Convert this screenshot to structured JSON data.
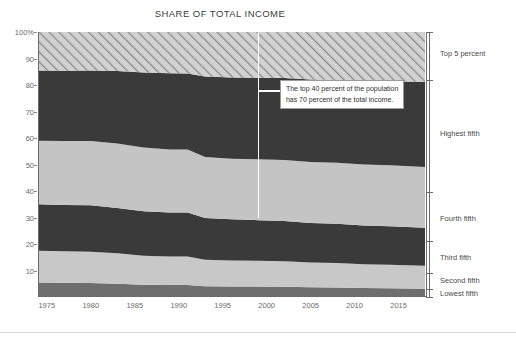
{
  "chart_data": {
    "type": "area",
    "title": "SHARE OF TOTAL INCOME",
    "xlabel": "",
    "ylabel": "",
    "xlim": [
      1974,
      2018
    ],
    "ylim": [
      0,
      100
    ],
    "grid": false,
    "legend_position": "right-bracket",
    "stacked": true,
    "y_ticks": [
      "100%",
      "90",
      "80",
      "70",
      "60",
      "50",
      "40",
      "30",
      "20",
      "10"
    ],
    "y_tick_values": [
      100,
      90,
      80,
      70,
      60,
      50,
      40,
      30,
      20,
      10
    ],
    "x_ticks": [
      "1975",
      "1980",
      "1985",
      "1990",
      "1995",
      "2000",
      "2005",
      "2010",
      "2015"
    ],
    "x_tick_values": [
      1975,
      1980,
      1985,
      1990,
      1995,
      2000,
      2005,
      2010,
      2015
    ],
    "x": [
      1974,
      1977,
      1980,
      1983,
      1986,
      1989,
      1991,
      1993,
      1996,
      1999,
      2002,
      2005,
      2008,
      2011,
      2014,
      2018
    ],
    "series": [
      {
        "name": "Lowest fifth",
        "color": "#6e6e6e",
        "values": [
          5.5,
          5.4,
          5.3,
          5.0,
          4.6,
          4.5,
          4.5,
          4.1,
          4.0,
          4.0,
          3.9,
          3.7,
          3.6,
          3.4,
          3.3,
          3.1
        ]
      },
      {
        "name": "Second fifth",
        "color": "#c8c8c8",
        "values": [
          12.0,
          11.9,
          11.8,
          11.5,
          11.0,
          10.8,
          10.8,
          10.0,
          9.8,
          9.7,
          9.6,
          9.3,
          9.2,
          9.0,
          8.9,
          8.7
        ]
      },
      {
        "name": "Third fifth",
        "color": "#3a3a3a",
        "values": [
          17.5,
          17.4,
          17.5,
          17.1,
          16.8,
          16.6,
          16.6,
          15.7,
          15.5,
          15.3,
          15.2,
          14.9,
          14.8,
          14.6,
          14.5,
          14.3
        ]
      },
      {
        "name": "Fourth fifth",
        "color": "#c4c4c4",
        "values": [
          24.0,
          24.2,
          24.3,
          24.3,
          24.0,
          23.8,
          23.8,
          23.0,
          22.9,
          23.0,
          23.0,
          23.0,
          23.1,
          23.0,
          23.0,
          23.0
        ]
      },
      {
        "name": "Highest fifth",
        "color": "#3a3a3a",
        "values": [
          26.5,
          26.5,
          26.6,
          27.4,
          28.3,
          28.7,
          28.6,
          30.4,
          30.6,
          30.7,
          30.9,
          31.2,
          31.1,
          31.4,
          31.6,
          32.1
        ]
      },
      {
        "name": "Top 5 percent",
        "color": "hatch",
        "values": [
          15.5,
          15.6,
          15.5,
          15.7,
          16.3,
          16.6,
          16.7,
          17.8,
          17.2,
          17.3,
          17.4,
          17.9,
          18.2,
          18.6,
          18.7,
          18.8
        ]
      }
    ],
    "boundaries_1974": [
      0,
      5.5,
      12.0,
      22.5,
      41.0,
      84.5,
      100
    ],
    "boundaries_2018": [
      0,
      3.0,
      9.0,
      21.0,
      39.5,
      82.0,
      100
    ],
    "annotation": {
      "text": "The top 40 percent of the population\nhas 70 percent of the total income.",
      "marker_year": 1999,
      "marker_from_pct": 100,
      "marker_to_pct": 30
    }
  },
  "categories": [
    {
      "label": "Top 5 percent",
      "center_pct": 92
    },
    {
      "label": "Highest fifth",
      "center_pct": 62
    },
    {
      "label": "Fourth fifth",
      "center_pct": 30
    },
    {
      "label": "Third fifth",
      "center_pct": 15
    },
    {
      "label": "Second fifth",
      "center_pct": 6.3
    },
    {
      "label": "Lowest fifth",
      "center_pct": 1.6
    }
  ]
}
